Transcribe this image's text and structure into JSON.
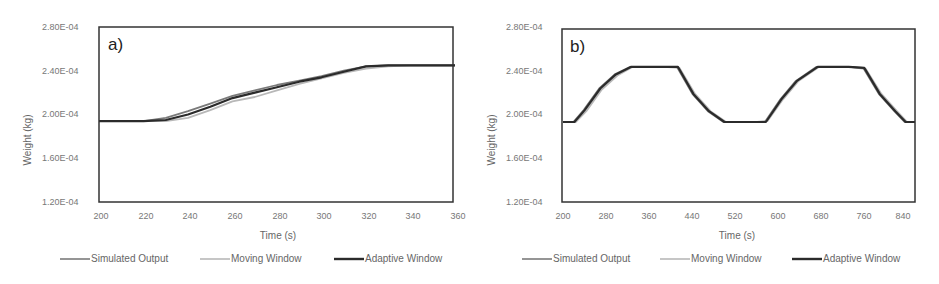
{
  "colors": {
    "simulated": "#7a7a7a",
    "moving": "#b8b8b8",
    "adaptive": "#2b2b2b",
    "frame": "#333333"
  },
  "chart_data": [
    {
      "type": "line",
      "panel_label": "a)",
      "title": "",
      "xlabel": "Time (s)",
      "ylabel": "Weight (kg)",
      "xlim": [
        200,
        360
      ],
      "ylim": [
        0.00012,
        0.00028
      ],
      "x_ticks": [
        "200",
        "220",
        "240",
        "260",
        "280",
        "300",
        "320",
        "340",
        "360"
      ],
      "y_ticks": [
        "2.80E-04",
        "2.40E-04",
        "2.00E-04",
        "1.60E-04",
        "1.20E-04"
      ],
      "grid": false,
      "legend_position": "bottom",
      "series": [
        {
          "name": "Simulated Output",
          "x": [
            200,
            220,
            230,
            240,
            250,
            260,
            270,
            280,
            290,
            300,
            310,
            320,
            330,
            340,
            360
          ],
          "y": [
            0.000194,
            0.000194,
            0.000197,
            0.000203,
            0.00021,
            0.000217,
            0.000222,
            0.000227,
            0.000231,
            0.000235,
            0.00024,
            0.000244,
            0.000245,
            0.000245,
            0.000245
          ]
        },
        {
          "name": "Moving Window",
          "x": [
            200,
            220,
            230,
            240,
            250,
            260,
            270,
            280,
            290,
            300,
            310,
            320,
            330,
            340,
            360
          ],
          "y": [
            0.000194,
            0.000194,
            0.000194,
            0.000197,
            0.000204,
            0.000212,
            0.000216,
            0.000222,
            0.000228,
            0.000233,
            0.000238,
            0.000242,
            0.000244,
            0.000245,
            0.000245
          ]
        },
        {
          "name": "Adaptive Window",
          "x": [
            200,
            220,
            230,
            240,
            250,
            260,
            270,
            280,
            290,
            300,
            310,
            320,
            330,
            340,
            360
          ],
          "y": [
            0.000194,
            0.000194,
            0.000195,
            0.0002,
            0.000207,
            0.000215,
            0.00022,
            0.000225,
            0.00023,
            0.000234,
            0.000239,
            0.000244,
            0.000245,
            0.000245,
            0.000245
          ]
        }
      ]
    },
    {
      "type": "line",
      "panel_label": "b)",
      "title": "",
      "xlabel": "Time (s)",
      "ylabel": "Weight (kg)",
      "xlim": [
        200,
        880
      ],
      "ylim": [
        0.00012,
        0.00028
      ],
      "x_ticks": [
        "200",
        "280",
        "360",
        "440",
        "520",
        "600",
        "680",
        "760",
        "840"
      ],
      "y_ticks": [
        "2.80E-04",
        "2.40E-04",
        "2.00E-04",
        "1.60E-04",
        "1.20E-04"
      ],
      "grid": false,
      "legend_position": "bottom",
      "series": [
        {
          "name": "Simulated Output",
          "x": [
            200,
            220,
            240,
            270,
            300,
            330,
            360,
            390,
            420,
            450,
            480,
            510,
            540,
            570,
            590,
            620,
            650,
            690,
            720,
            750,
            780,
            810,
            840,
            860,
            880
          ],
          "y": [
            0.000194,
            0.000194,
            0.000205,
            0.000225,
            0.000238,
            0.000245,
            0.000245,
            0.000245,
            0.000245,
            0.00022,
            0.000204,
            0.000194,
            0.000194,
            0.000194,
            0.000194,
            0.000215,
            0.000232,
            0.000245,
            0.000245,
            0.000245,
            0.000244,
            0.00022,
            0.000204,
            0.000194,
            0.000194
          ]
        },
        {
          "name": "Moving Window",
          "x": [
            200,
            225,
            245,
            275,
            305,
            335,
            365,
            395,
            425,
            455,
            485,
            515,
            545,
            575,
            595,
            625,
            655,
            695,
            725,
            755,
            785,
            815,
            845,
            865,
            880
          ],
          "y": [
            0.000194,
            0.000194,
            0.000204,
            0.000224,
            0.000237,
            0.000245,
            0.000245,
            0.000245,
            0.000244,
            0.00022,
            0.000204,
            0.000194,
            0.000194,
            0.000194,
            0.000195,
            0.000215,
            0.000232,
            0.000245,
            0.000245,
            0.000245,
            0.000243,
            0.00022,
            0.000204,
            0.000194,
            0.000194
          ]
        },
        {
          "name": "Adaptive Window",
          "x": [
            200,
            222,
            242,
            272,
            302,
            332,
            362,
            392,
            422,
            452,
            482,
            512,
            542,
            572,
            592,
            622,
            652,
            692,
            722,
            752,
            782,
            812,
            842,
            862,
            880
          ],
          "y": [
            0.000194,
            0.000194,
            0.000205,
            0.000225,
            0.000238,
            0.000245,
            0.000245,
            0.000245,
            0.000245,
            0.00022,
            0.000204,
            0.000194,
            0.000194,
            0.000194,
            0.000194,
            0.000215,
            0.000232,
            0.000245,
            0.000245,
            0.000245,
            0.000244,
            0.00022,
            0.000204,
            0.000194,
            0.000194
          ]
        }
      ]
    }
  ],
  "legend": [
    {
      "label": "Simulated Output"
    },
    {
      "label": "Moving Window"
    },
    {
      "label": "Adaptive Window"
    }
  ]
}
